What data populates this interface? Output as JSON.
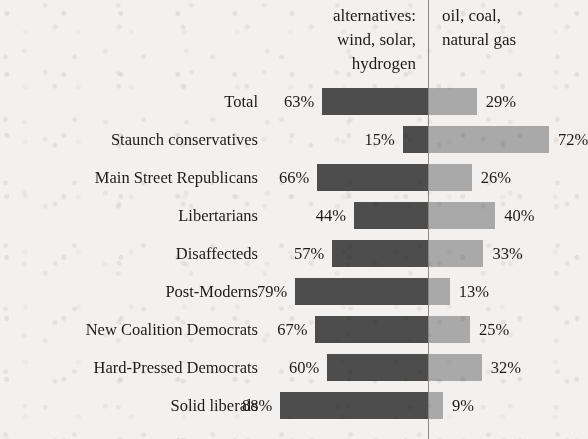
{
  "header": {
    "left_column": "alternatives:\nwind, solar,\nhydrogen",
    "right_column": "oil, coal,\nnatural gas"
  },
  "colors": {
    "left_bar": "#4d4d4d",
    "right_bar": "#a9a9a9",
    "axis": "#8d8a86",
    "background": "#f3f1ef",
    "text": "#1b1b1b"
  },
  "chart_data": {
    "type": "bar",
    "orientation": "horizontal-diverging",
    "title": "",
    "xlabel": "",
    "ylabel": "",
    "grid": false,
    "legend_position": "top",
    "axis_center_value": 0,
    "value_suffix": "%",
    "categories": [
      "Total",
      "Staunch conservatives",
      "Main Street Republicans",
      "Libertarians",
      "Disaffecteds",
      "Post-Moderns",
      "New Coalition Democrats",
      "Hard-Pressed Democrats",
      "Solid liberals"
    ],
    "series": [
      {
        "name": "alternatives: wind, solar, hydrogen",
        "direction": "left",
        "color": "#4d4d4d",
        "values": [
          63,
          15,
          66,
          44,
          57,
          79,
          67,
          60,
          88
        ],
        "labels": [
          "63%",
          "15%",
          "66%",
          "44%",
          "57%",
          "79%",
          "67%",
          "60%",
          "88%"
        ]
      },
      {
        "name": "oil, coal, natural gas",
        "direction": "right",
        "color": "#a9a9a9",
        "values": [
          29,
          72,
          26,
          40,
          33,
          13,
          25,
          32,
          9
        ],
        "labels": [
          "29%",
          "72%",
          "26%",
          "40%",
          "33%",
          "13%",
          "25%",
          "32%",
          "9%"
        ]
      }
    ]
  },
  "layout": {
    "axis_x": 428,
    "px_per_percent": 1.68,
    "first_row_top": 88,
    "row_pitch": 38,
    "bar_height": 27,
    "label_right_edge": 258
  }
}
